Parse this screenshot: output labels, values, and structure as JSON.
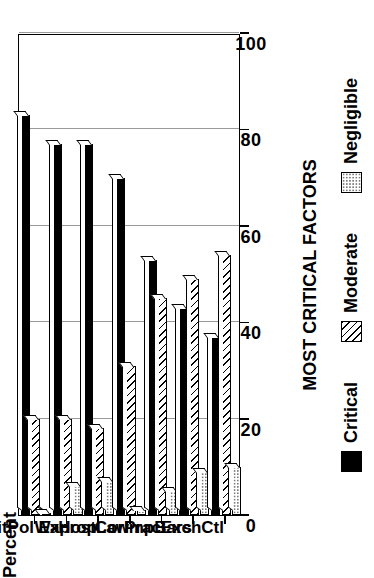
{
  "chart_data": {
    "type": "bar",
    "orientation": "horizontal-rotated",
    "title": "",
    "xlabel": "MOST CRITICAL FACTORS",
    "ylabel": "Percent",
    "ylim": [
      0,
      100
    ],
    "yticks": [
      0,
      20,
      40,
      60,
      80,
      100
    ],
    "ytick_labels": [
      "0",
      "20",
      "40",
      "60",
      "80",
      "100"
    ],
    "grid": true,
    "legend_position": "bottom",
    "categories": [
      "RemitPol",
      "War",
      "Exprop",
      "HostLaw",
      "CorPrac",
      "ImpBars",
      "ExchCtl"
    ],
    "series": [
      {
        "name": "Critical",
        "color": "#000000",
        "pattern": "solid",
        "values": [
          83,
          77,
          77,
          70,
          53,
          43,
          37
        ]
      },
      {
        "name": "Moderate",
        "color": "#000000",
        "pattern": "hatch",
        "values": [
          20,
          20,
          18,
          31,
          45,
          49,
          54
        ]
      },
      {
        "name": "Negligible",
        "color": "#7a7a7a",
        "pattern": "dotted",
        "values": [
          0,
          6,
          7,
          1,
          5,
          9,
          10
        ]
      }
    ]
  },
  "axes": {
    "value_axis_title": "Percent",
    "category_axis_title": "MOST CRITICAL FACTORS"
  },
  "legend": {
    "items": [
      {
        "label": "Critical"
      },
      {
        "label": "Moderate"
      },
      {
        "label": "Negligible"
      }
    ]
  }
}
